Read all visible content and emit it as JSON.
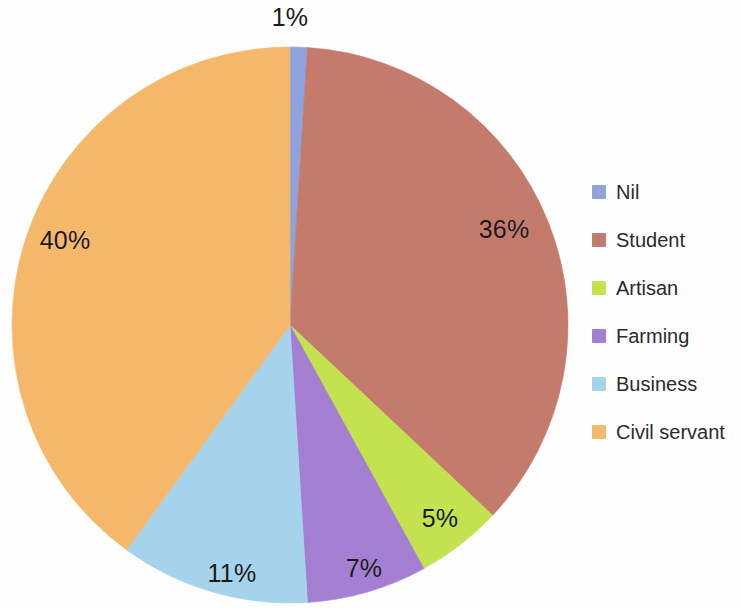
{
  "chart_data": {
    "type": "pie",
    "title": "",
    "subtitle": "",
    "xlabel": "",
    "ylabel": "",
    "legend_position": "right",
    "grid": false,
    "start_angle_deg": 0,
    "direction": "clockwise",
    "categories": [
      "Nil",
      "Student",
      "Artisan",
      "Farming",
      "Business",
      "Civil servant"
    ],
    "values": [
      1,
      36,
      5,
      7,
      11,
      40
    ],
    "value_unit": "%",
    "data_labels": [
      "1%",
      "36%",
      "5%",
      "7%",
      "11%",
      "40%"
    ],
    "colors": [
      "#8FA4DE",
      "#C57B6C",
      "#C3E34F",
      "#A57FD2",
      "#A5D4EC",
      "#F6B96B"
    ],
    "slices": [
      {
        "label": "Nil",
        "value": 1,
        "data_label": "1%",
        "color": "#8FA4DE"
      },
      {
        "label": "Student",
        "value": 36,
        "data_label": "36%",
        "color": "#C57B6C"
      },
      {
        "label": "Artisan",
        "value": 5,
        "data_label": "5%",
        "color": "#C3E34F"
      },
      {
        "label": "Farming",
        "value": 7,
        "data_label": "7%",
        "color": "#A57FD2"
      },
      {
        "label": "Business",
        "value": 11,
        "data_label": "11%",
        "color": "#A5D4EC"
      },
      {
        "label": "Civil servant",
        "value": 40,
        "data_label": "40%",
        "color": "#F6B96B"
      }
    ]
  },
  "legend": {
    "items": [
      {
        "label": "Nil",
        "color": "#8FA4DE"
      },
      {
        "label": "Student",
        "color": "#C57B6C"
      },
      {
        "label": "Artisan",
        "color": "#C3E34F"
      },
      {
        "label": "Farming",
        "color": "#A57FD2"
      },
      {
        "label": "Business",
        "color": "#A5D4EC"
      },
      {
        "label": "Civil servant",
        "color": "#F6B96B"
      }
    ]
  },
  "labels": {
    "nil": "1%",
    "student": "36%",
    "artisan": "5%",
    "farming": "7%",
    "business": "11%",
    "civil_servant": "40%"
  },
  "geometry": {
    "center_x": 290,
    "center_y": 325,
    "radius": 278
  }
}
